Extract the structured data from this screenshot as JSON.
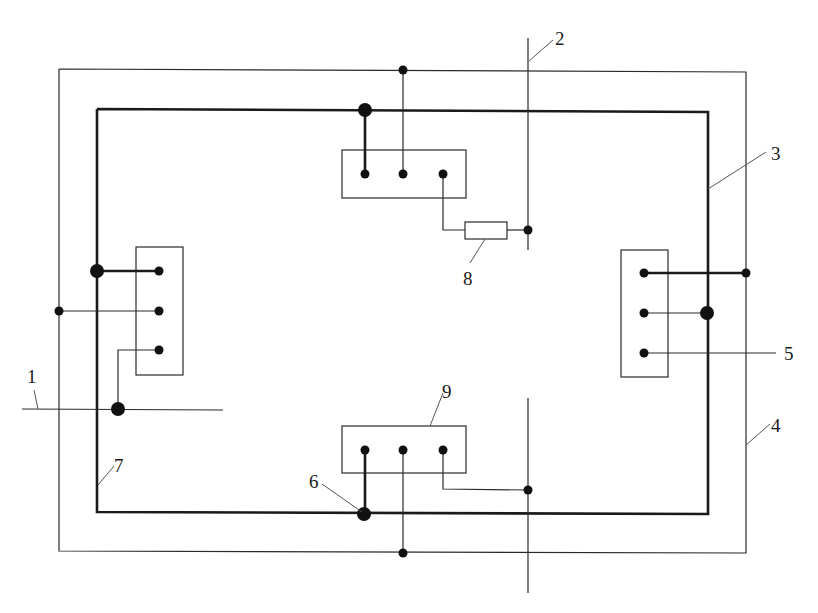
{
  "diagram": {
    "type": "electrical grounding / wiring schematic",
    "colors": {
      "line": "#2a2a2a",
      "background": "#ffffff"
    },
    "labels": [
      {
        "id": "1",
        "text": "1"
      },
      {
        "id": "2",
        "text": "2"
      },
      {
        "id": "3",
        "text": "3"
      },
      {
        "id": "4",
        "text": "4"
      },
      {
        "id": "5",
        "text": "5"
      },
      {
        "id": "6",
        "text": "6"
      },
      {
        "id": "7",
        "text": "7"
      },
      {
        "id": "8",
        "text": "8"
      },
      {
        "id": "9",
        "text": "9"
      }
    ],
    "components": {
      "outer_loop": "4",
      "inner_loop_thick": "3 / 7",
      "horizontal_line_left": "1",
      "vertical_line_top": "2",
      "right_terminal_lead": "5",
      "junction_bottom": "6",
      "resistor": "8",
      "terminal_block_bottom": "9",
      "terminal_blocks": [
        "top",
        "bottom",
        "left",
        "right"
      ],
      "terminals_per_block": 3
    }
  }
}
